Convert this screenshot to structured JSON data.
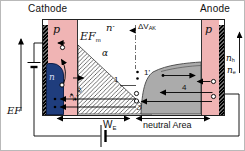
{
  "figure": {
    "cathode_title": "Cathode",
    "anode_title": "Anode"
  },
  "regions": {
    "p_cathode": "p",
    "n_well": "n",
    "n_drift": {
      "base": "n",
      "sup": "-"
    },
    "p_anode": "p",
    "neutral_area": "neutral Area"
  },
  "energy": {
    "ef_axis": "EF",
    "ef_metal": {
      "base": "EF",
      "sub": "m"
    },
    "delta_v": {
      "base": "ΔV",
      "sub": "AK"
    },
    "alpha": "α"
  },
  "flows": {
    "f1": "1",
    "f1_prime": "1'",
    "f2": "2, e",
    "f3": "3",
    "f4": "4"
  },
  "measures": {
    "we": {
      "base": "W",
      "sub": "E"
    },
    "nh": {
      "base": "n",
      "sub": "h"
    },
    "ne": {
      "base": "n",
      "sub": "e"
    }
  },
  "colors": {
    "p_region": "#f0b4b4",
    "n_well": "#1f3d7d",
    "carrier_area": "#ababab",
    "contact": "#111111"
  }
}
